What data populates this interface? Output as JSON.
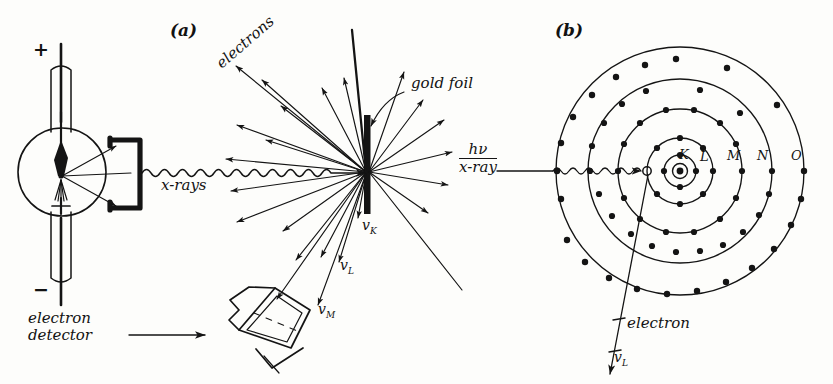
{
  "figure": {
    "background_color": "#fdfdfb",
    "ink_color": "#141414",
    "width": 833,
    "height": 384
  },
  "panel_a": {
    "tag": "(a)",
    "tube": {
      "anode_sign": "+",
      "cathode_sign": "−"
    },
    "beam_label": "x-rays",
    "electrons_label": "electrons",
    "foil_label": "gold foil",
    "detector_label_line1": "electron",
    "detector_label_line2": "detector",
    "velocities": [
      {
        "symbol": "v",
        "subscript": "K"
      },
      {
        "symbol": "v",
        "subscript": "L"
      },
      {
        "symbol": "v",
        "subscript": "M"
      }
    ]
  },
  "panel_b": {
    "tag": "(b)",
    "incident_top": "hν",
    "incident_bottom": "x-ray",
    "shells": [
      {
        "letter": "K",
        "radius": 16,
        "electron_count": 4
      },
      {
        "letter": "L",
        "radius": 33,
        "electron_count": 8
      },
      {
        "letter": "M",
        "radius": 62,
        "electron_count": 14
      },
      {
        "letter": "N",
        "radius": 92,
        "electron_count": 18
      },
      {
        "letter": "O",
        "radius": 124,
        "electron_count": 22
      }
    ],
    "ejected_label": "electron",
    "ejected_velocity": {
      "symbol": "v",
      "subscript": "L"
    },
    "vacancy_note": "hole"
  }
}
